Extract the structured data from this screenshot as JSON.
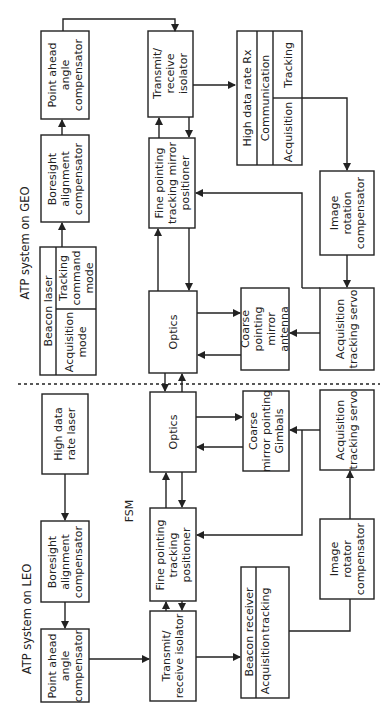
{
  "diagram": {
    "title_geo": "ATP system on GEO",
    "title_leo": "ATP system on LEO",
    "fsm_label": "FSM",
    "geo": {
      "point_ahead": "Point ahead\nangle\ncompensator",
      "boresight": "Boresight\nalignment\ncompensator",
      "beacon_laser": "Beacon laser",
      "acquisition_mode": "Acquisition\nmode",
      "tracking_command_mode": "Tracking\ncommand\nmode",
      "transmit_receive": "Transmit/\nreceive\nisolator",
      "fine_pointing": "Fine pointing\ntracking mirror\npositioner",
      "optics": "Optics",
      "high_data_rate_rx": "High data rate Rx",
      "communication": "Communication",
      "tracking": "Tracking",
      "acquisition": "Acquisition",
      "image_rotation": "Image\nrotation\ncompensator",
      "coarse_pointing": "Coarse\npointing\nmirror\nantenna",
      "acq_tracking_servo": "Acquisition\ntracking servo"
    },
    "leo": {
      "high_data_rate_laser": "High data\nrate laser",
      "boresight": "Boresight\nalignment\ncompensator",
      "point_ahead": "Point ahead\nangle\ncompensator",
      "optics": "Optics",
      "fine_pointing": "Fine pointing\ntracking\npositioner",
      "transmit_receive": "Transmit/\nreceive isolator",
      "coarse_mirror": "Coarse\nmirror pointing\nGimbals",
      "acq_tracking_servo": "Acquisition\ntracking servo",
      "image_rotator": "Image\nrotator\ncompensator",
      "beacon_receiver": "Beacon receiver",
      "acquisition": "Acquisition",
      "tracking": "tracking"
    }
  }
}
